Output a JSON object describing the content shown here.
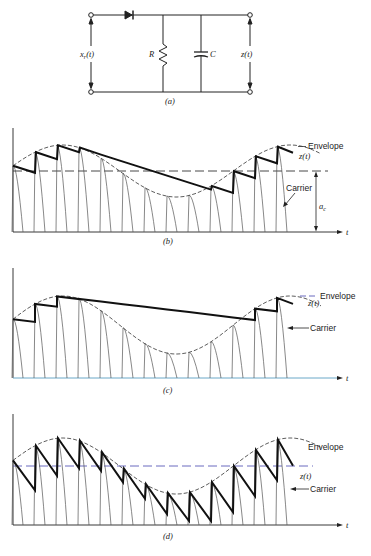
{
  "figure": {
    "panels": [
      {
        "id": "a",
        "caption": "(a)",
        "type": "circuit",
        "components": [
          "diode",
          "R",
          "C"
        ],
        "labels": {
          "input": "x_r(t)",
          "input_main": "x",
          "input_sub": "r",
          "input_arg": "(t)",
          "resistor": "R",
          "capacitor": "C",
          "output": "z(t)"
        }
      },
      {
        "id": "b",
        "caption": "(b)",
        "labels": {
          "envelope": "Envelope",
          "output": "z(t)",
          "carrier": "Carrier",
          "amplitude": "a",
          "amplitude_sub": "c",
          "time_axis": "t"
        },
        "description": "Proper RC time constant: z(t) follows envelope"
      },
      {
        "id": "c",
        "caption": "(c)",
        "labels": {
          "envelope": "Envelope",
          "output": "z(t)",
          "carrier": "Carrier",
          "time_axis": "t"
        },
        "description": "RC too large: z(t) fails to follow falling envelope"
      },
      {
        "id": "d",
        "caption": "(d)",
        "labels": {
          "envelope": "Envelope",
          "output": "z(t)",
          "carrier": "Carrier",
          "time_axis": "t"
        },
        "description": "RC too small: z(t) decays too fast (sawtooth ripple)"
      }
    ]
  },
  "colors": {
    "ink": "#222222",
    "thin": "#555555",
    "dash_blue": "#5a5ab8",
    "axis_blue": "#7ab8d8"
  }
}
